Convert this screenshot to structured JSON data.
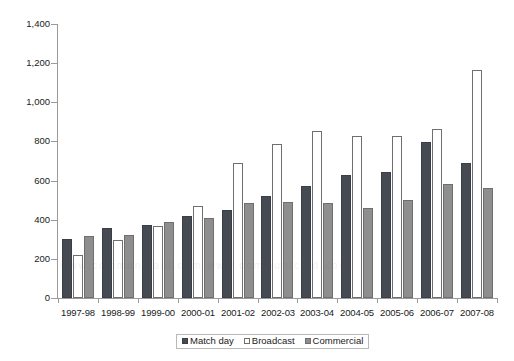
{
  "chart_data": {
    "type": "bar",
    "title": "",
    "subtitle": "",
    "xlabel": "",
    "ylabel": "",
    "ylim": [
      0,
      1400
    ],
    "y_ticks": [
      "0",
      "200",
      "400",
      "600",
      "800",
      "1,000",
      "1,200",
      "1,400"
    ],
    "y_tick_values": [
      0,
      200,
      400,
      600,
      800,
      1000,
      1200,
      1400
    ],
    "grid": false,
    "legend_position": "bottom-center",
    "categories": [
      "1997-98",
      "1998-99",
      "1999-00",
      "2000-01",
      "2001-02",
      "2002-03",
      "2003-04",
      "2004-05",
      "2005-06",
      "2006-07",
      "2007-08"
    ],
    "series": [
      {
        "name": "Match day",
        "color": "#464a53",
        "values": [
          300,
          358,
          375,
          420,
          450,
          520,
          570,
          630,
          645,
          795,
          690
        ]
      },
      {
        "name": "Broadcast",
        "color": "#ffffff",
        "values": [
          220,
          295,
          370,
          470,
          690,
          785,
          855,
          830,
          830,
          865,
          1165
        ]
      },
      {
        "name": "Commercial",
        "color": "#8e8e8e",
        "values": [
          315,
          320,
          390,
          410,
          485,
          490,
          485,
          460,
          500,
          580,
          560
        ]
      }
    ]
  },
  "legend": {
    "entries": [
      {
        "label": "Match day",
        "key": "matchday"
      },
      {
        "label": "Broadcast",
        "key": "broadcast"
      },
      {
        "label": "Commercial",
        "key": "commercial"
      }
    ]
  },
  "watermark": {
    "text": "www.communicaid.com www.communicaid.com"
  }
}
